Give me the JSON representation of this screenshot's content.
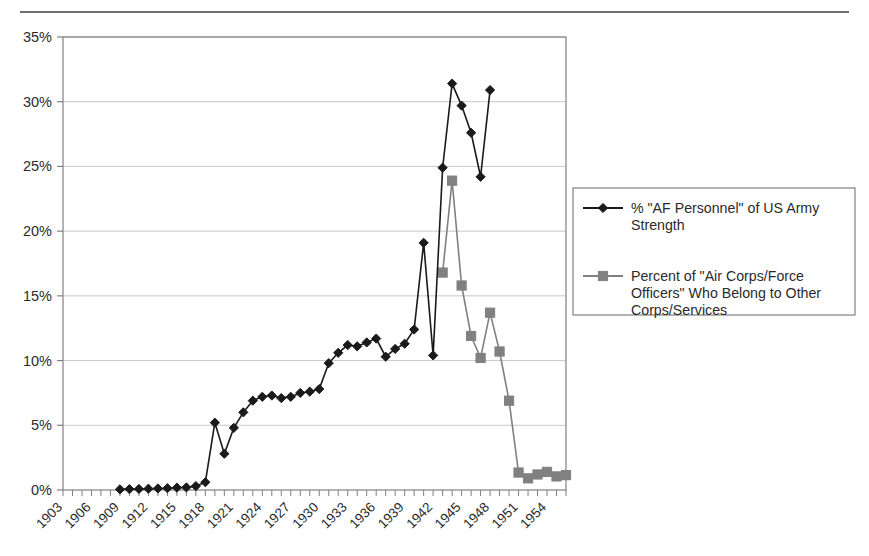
{
  "figure": {
    "background_color": "#ffffff",
    "top_rule_color": "#6e6e6e",
    "plot_border_color": "#808080",
    "gridline_color": "#c8c8c8"
  },
  "legend": {
    "border_color": "#808080",
    "entries": [
      {
        "label": "% \"AF Personnel\" of US Army Strength",
        "line_1": "% \"AF Personnel\" of US Army",
        "line_2": "Strength",
        "color": "#1a1a1a",
        "marker": "diamond"
      },
      {
        "label": "Percent of \"Air Corps/Force Officers\" Who Belong to Other Corps/Services",
        "line_1": "Percent of \"Air Corps/Force",
        "line_2": "Officers\" Who Belong to Other",
        "line_3": "Corps/Services",
        "color": "#808080",
        "marker": "square"
      }
    ]
  },
  "chart_data": {
    "type": "line",
    "title": "",
    "xlabel": "",
    "ylabel": "",
    "xlim": [
      1903,
      1956
    ],
    "ylim": [
      0,
      35
    ],
    "grid": true,
    "legend_position": "right",
    "y_ticks": [
      0,
      5,
      10,
      15,
      20,
      25,
      30,
      35
    ],
    "y_tick_labels": [
      "0%",
      "5%",
      "10%",
      "15%",
      "20%",
      "25%",
      "30%",
      "35%"
    ],
    "x_ticks": [
      1903,
      1906,
      1909,
      1912,
      1915,
      1918,
      1921,
      1924,
      1927,
      1930,
      1933,
      1936,
      1939,
      1942,
      1945,
      1948,
      1951,
      1954
    ],
    "x_tick_labels": [
      "1903",
      "1906",
      "1909",
      "1912",
      "1915",
      "1918",
      "1921",
      "1924",
      "1927",
      "1930",
      "1933",
      "1936",
      "1939",
      "1942",
      "1945",
      "1948",
      "1951",
      "1954"
    ],
    "x_tick_rotation": 45,
    "series": [
      {
        "name": "% \"AF Personnel\" of US Army Strength",
        "color": "#1a1a1a",
        "marker": "diamond",
        "points": [
          {
            "x": 1909,
            "y": 0.05
          },
          {
            "x": 1910,
            "y": 0.07
          },
          {
            "x": 1911,
            "y": 0.08
          },
          {
            "x": 1912,
            "y": 0.1
          },
          {
            "x": 1913,
            "y": 0.12
          },
          {
            "x": 1914,
            "y": 0.14
          },
          {
            "x": 1915,
            "y": 0.18
          },
          {
            "x": 1916,
            "y": 0.2
          },
          {
            "x": 1917,
            "y": 0.3
          },
          {
            "x": 1918,
            "y": 0.6
          },
          {
            "x": 1919,
            "y": 5.2
          },
          {
            "x": 1920,
            "y": 2.8
          },
          {
            "x": 1921,
            "y": 4.8
          },
          {
            "x": 1922,
            "y": 6.0
          },
          {
            "x": 1923,
            "y": 6.9
          },
          {
            "x": 1924,
            "y": 7.2
          },
          {
            "x": 1925,
            "y": 7.3
          },
          {
            "x": 1926,
            "y": 7.1
          },
          {
            "x": 1927,
            "y": 7.2
          },
          {
            "x": 1928,
            "y": 7.5
          },
          {
            "x": 1929,
            "y": 7.6
          },
          {
            "x": 1930,
            "y": 7.8
          },
          {
            "x": 1931,
            "y": 9.8
          },
          {
            "x": 1932,
            "y": 10.6
          },
          {
            "x": 1933,
            "y": 11.2
          },
          {
            "x": 1934,
            "y": 11.1
          },
          {
            "x": 1935,
            "y": 11.4
          },
          {
            "x": 1936,
            "y": 11.7
          },
          {
            "x": 1937,
            "y": 10.3
          },
          {
            "x": 1938,
            "y": 10.9
          },
          {
            "x": 1939,
            "y": 11.3
          },
          {
            "x": 1940,
            "y": 12.4
          },
          {
            "x": 1941,
            "y": 19.1
          },
          {
            "x": 1942,
            "y": 10.4
          },
          {
            "x": 1943,
            "y": 24.9
          },
          {
            "x": 1944,
            "y": 31.4
          },
          {
            "x": 1945,
            "y": 29.7
          },
          {
            "x": 1946,
            "y": 27.6
          },
          {
            "x": 1947,
            "y": 24.2
          },
          {
            "x": 1948,
            "y": 30.9
          }
        ]
      },
      {
        "name": "Percent of \"Air Corps/Force Officers\" Who Belong to Other Corps/Services",
        "color": "#808080",
        "marker": "square",
        "points": [
          {
            "x": 1943,
            "y": 16.8
          },
          {
            "x": 1944,
            "y": 23.9
          },
          {
            "x": 1945,
            "y": 15.8
          },
          {
            "x": 1946,
            "y": 11.9
          },
          {
            "x": 1947,
            "y": 10.2
          },
          {
            "x": 1948,
            "y": 13.7
          },
          {
            "x": 1949,
            "y": 10.7
          },
          {
            "x": 1950,
            "y": 6.9
          },
          {
            "x": 1951,
            "y": 1.35
          },
          {
            "x": 1952,
            "y": 0.9
          },
          {
            "x": 1953,
            "y": 1.2
          },
          {
            "x": 1954,
            "y": 1.4
          },
          {
            "x": 1955,
            "y": 1.05
          },
          {
            "x": 1956,
            "y": 1.15
          }
        ]
      }
    ]
  }
}
